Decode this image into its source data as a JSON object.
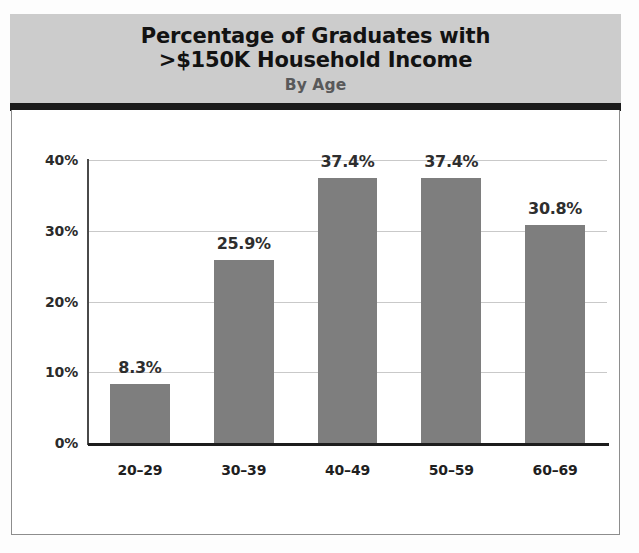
{
  "header": {
    "title_line1": "Percentage of Graduates with",
    "title_line2": ">$150K Household Income",
    "subtitle": "By Age",
    "band_color": "#cccccc",
    "rule_color": "#1b1b1b"
  },
  "chart_data": {
    "type": "bar",
    "title": "Percentage of Graduates with >$150K Household Income",
    "subtitle": "By Age",
    "xlabel": "",
    "ylabel": "",
    "categories": [
      "20–29",
      "30–39",
      "40–49",
      "50–59",
      "60–69"
    ],
    "values": [
      8.3,
      25.9,
      37.4,
      37.4,
      30.8
    ],
    "data_labels": [
      "8.3%",
      "25.9%",
      "37.4%",
      "37.4%",
      "30.8%"
    ],
    "ylim": [
      0,
      40
    ],
    "yticks": [
      0,
      10,
      20,
      30,
      40
    ],
    "ytick_labels": [
      "0%",
      "10%",
      "20%",
      "30%",
      "40%"
    ],
    "grid": true,
    "legend": "none",
    "bar_color": "#7e7e7e",
    "gridline_color": "#c9c9c9",
    "axis_color": "#1d1d1d"
  }
}
